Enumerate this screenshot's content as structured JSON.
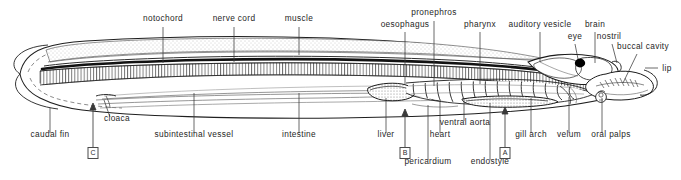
{
  "figure": {
    "background_color": "#ffffff",
    "ink_color": "#1a1a1a",
    "label_color": "#262626"
  },
  "labels": {
    "top": [
      {
        "id": "notochord",
        "text": "notochord",
        "x": 163,
        "y": 20,
        "leader": {
          "x1": 163,
          "y1": 27,
          "x2": 163,
          "y2": 63
        }
      },
      {
        "id": "nerve-cord",
        "text": "nerve cord",
        "x": 234,
        "y": 20,
        "leader": {
          "x1": 234,
          "y1": 27,
          "x2": 234,
          "y2": 62
        }
      },
      {
        "id": "muscle",
        "text": "muscle",
        "x": 299,
        "y": 20,
        "leader": {
          "x1": 299,
          "y1": 27,
          "x2": 299,
          "y2": 55
        }
      },
      {
        "id": "oesophagus",
        "text": "oesophagus",
        "x": 405,
        "y": 26,
        "leader": {
          "x1": 405,
          "y1": 32,
          "x2": 405,
          "y2": 85
        }
      },
      {
        "id": "pronephros",
        "text": "pronephros",
        "x": 434,
        "y": 14,
        "leader": {
          "x1": 434,
          "y1": 21,
          "x2": 434,
          "y2": 86
        }
      },
      {
        "id": "pharynx",
        "text": "pharynx",
        "x": 480,
        "y": 26,
        "leader": {
          "x1": 480,
          "y1": 32,
          "x2": 480,
          "y2": 84
        }
      },
      {
        "id": "auditory-vesicle",
        "text": "auditory vesicle",
        "x": 540,
        "y": 26,
        "leader": {
          "x1": 540,
          "y1": 32,
          "x2": 540,
          "y2": 62
        }
      },
      {
        "id": "brain",
        "text": "brain",
        "x": 595,
        "y": 26,
        "leader": {
          "x1": 595,
          "y1": 32,
          "x2": 595,
          "y2": 63
        }
      },
      {
        "id": "eye",
        "text": "eye",
        "x": 575,
        "y": 38,
        "leader": {
          "x1": 575,
          "y1": 44,
          "x2": 578,
          "y2": 59
        }
      },
      {
        "id": "nostril",
        "text": "nostril",
        "x": 609,
        "y": 38,
        "leader": {
          "x1": 612,
          "y1": 44,
          "x2": 617,
          "y2": 63
        }
      },
      {
        "id": "buccal-cavity",
        "text": "buccal cavity",
        "x": 644,
        "y": 48,
        "leader": {
          "x1": 637,
          "y1": 54,
          "x2": 623,
          "y2": 83
        }
      },
      {
        "id": "lip",
        "text": "lip",
        "x": 666,
        "y": 70,
        "leader": {
          "x1": 658,
          "y1": 68,
          "x2": 645,
          "y2": 68
        }
      }
    ],
    "bottom": [
      {
        "id": "caudal-fin",
        "text": "caudal fin",
        "x": 50,
        "y": 136,
        "leader": {
          "x1": 50,
          "y1": 133,
          "x2": 50,
          "y2": 108
        }
      },
      {
        "id": "cloaca",
        "text": "cloaca",
        "x": 116,
        "y": 120,
        "leader": {
          "x1": 110,
          "y1": 117,
          "x2": 104,
          "y2": 100
        }
      },
      {
        "id": "subintestinal-vessel",
        "text": "subintestinal vessel",
        "x": 194,
        "y": 136,
        "leader": {
          "x1": 194,
          "y1": 133,
          "x2": 194,
          "y2": 93
        }
      },
      {
        "id": "intestine",
        "text": "intestine",
        "x": 299,
        "y": 136,
        "leader": {
          "x1": 299,
          "y1": 133,
          "x2": 299,
          "y2": 93
        }
      },
      {
        "id": "liver",
        "text": "liver",
        "x": 386,
        "y": 136,
        "leader": {
          "x1": 386,
          "y1": 133,
          "x2": 386,
          "y2": 98
        }
      },
      {
        "id": "heart",
        "text": "heart",
        "x": 440,
        "y": 136,
        "leader": {
          "x1": 440,
          "y1": 133,
          "x2": 440,
          "y2": 101
        }
      },
      {
        "id": "ventral-aorta",
        "text": "ventral aorta",
        "x": 464,
        "y": 124,
        "leader": {
          "x1": 464,
          "y1": 121,
          "x2": 464,
          "y2": 99
        }
      },
      {
        "id": "gill-arch",
        "text": "gill arch",
        "x": 531,
        "y": 136,
        "leader": {
          "x1": 531,
          "y1": 133,
          "x2": 531,
          "y2": 98
        }
      },
      {
        "id": "velum",
        "text": "velum",
        "x": 569,
        "y": 136,
        "leader": {
          "x1": 569,
          "y1": 133,
          "x2": 569,
          "y2": 97
        }
      },
      {
        "id": "oral-palps",
        "text": "oral palps",
        "x": 610,
        "y": 136,
        "leader": {
          "x1": 602,
          "y1": 133,
          "x2": 602,
          "y2": 98
        }
      },
      {
        "id": "pericardium",
        "text": "pericardium",
        "x": 428,
        "y": 163,
        "leader": {
          "x1": 428,
          "y1": 160,
          "x2": 428,
          "y2": 105
        }
      },
      {
        "id": "endostyle",
        "text": "endostyle",
        "x": 490,
        "y": 163,
        "leader": {
          "x1": 490,
          "y1": 160,
          "x2": 490,
          "y2": 103
        }
      }
    ]
  },
  "section_markers": [
    {
      "id": "marker-c",
      "letter": "C",
      "x": 93,
      "y": 147,
      "arrow": {
        "x1": 93,
        "y1": 147,
        "x2": 93,
        "y2": 104
      }
    },
    {
      "id": "marker-b",
      "letter": "B",
      "x": 405,
      "y": 147,
      "arrow": {
        "x1": 405,
        "y1": 147,
        "x2": 405,
        "y2": 110
      }
    },
    {
      "id": "marker-a",
      "letter": "A",
      "x": 505,
      "y": 147,
      "arrow": {
        "x1": 505,
        "y1": 147,
        "x2": 505,
        "y2": 108
      }
    }
  ]
}
